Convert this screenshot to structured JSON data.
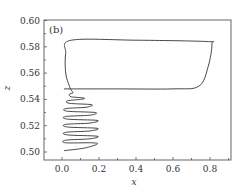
{
  "chart_data": {
    "type": "line",
    "title": "",
    "panel_label": "(b)",
    "xlabel": "x",
    "ylabel": "z",
    "xlim": [
      -0.1,
      0.91
    ],
    "ylim": [
      0.495,
      0.6
    ],
    "grid": false,
    "legend": null,
    "x_ticks": [
      "0.0",
      "0.2",
      "0.4",
      "0.6",
      "0.8"
    ],
    "x_tick_values": [
      0.0,
      0.2,
      0.4,
      0.6,
      0.8
    ],
    "y_ticks": [
      "0.50",
      "0.52",
      "0.54",
      "0.56",
      "0.58",
      "0.60"
    ],
    "y_tick_values": [
      0.5,
      0.52,
      0.54,
      0.56,
      0.58,
      0.6
    ],
    "series": [
      {
        "name": "trajectory",
        "description": "Phase-space trajectory: outward spiral from (0.01, 0.501) up to z≈0.545, then large relaxation loop along z≈0.585 (x 0.04–0.81) and z≈0.548",
        "points": [
          [
            0.01,
            0.501
          ],
          [
            0.12,
            0.503
          ],
          [
            0.19,
            0.506
          ],
          [
            0.16,
            0.507
          ],
          [
            0.02,
            0.507
          ],
          [
            0.02,
            0.509
          ],
          [
            0.15,
            0.51
          ],
          [
            0.19,
            0.512
          ],
          [
            0.03,
            0.513
          ],
          [
            0.02,
            0.515
          ],
          [
            0.15,
            0.516
          ],
          [
            0.19,
            0.518
          ],
          [
            0.03,
            0.519
          ],
          [
            0.02,
            0.521
          ],
          [
            0.15,
            0.522
          ],
          [
            0.19,
            0.524
          ],
          [
            0.03,
            0.525
          ],
          [
            0.02,
            0.527
          ],
          [
            0.15,
            0.528
          ],
          [
            0.18,
            0.53
          ],
          [
            0.03,
            0.531
          ],
          [
            0.02,
            0.533
          ],
          [
            0.13,
            0.534
          ],
          [
            0.16,
            0.536
          ],
          [
            0.04,
            0.537
          ],
          [
            0.03,
            0.539
          ],
          [
            0.1,
            0.54
          ],
          [
            0.12,
            0.541
          ],
          [
            0.05,
            0.542
          ],
          [
            0.04,
            0.544
          ],
          [
            0.06,
            0.545
          ],
          [
            0.05,
            0.547
          ],
          [
            0.04,
            0.55
          ],
          [
            0.02,
            0.56
          ],
          [
            0.02,
            0.575
          ],
          [
            0.05,
            0.585
          ],
          [
            0.4,
            0.585
          ],
          [
            0.78,
            0.584
          ],
          [
            0.81,
            0.582
          ],
          [
            0.79,
            0.565
          ],
          [
            0.74,
            0.55
          ],
          [
            0.6,
            0.548
          ],
          [
            0.3,
            0.548
          ],
          [
            0.01,
            0.548
          ]
        ]
      }
    ]
  },
  "axes": {
    "xlabel": "x",
    "ylabel": "z",
    "panel_label": "(b)"
  }
}
